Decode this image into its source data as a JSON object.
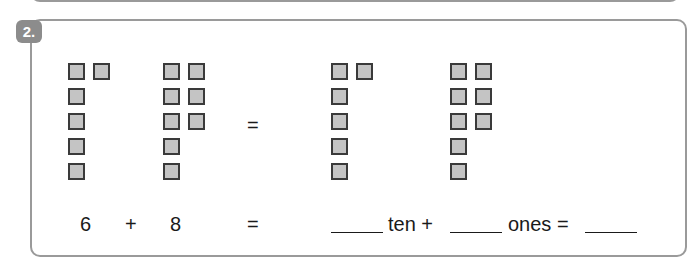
{
  "question": {
    "number": "2."
  },
  "groups": [
    {
      "name": "addend-1-blocks",
      "count": 6,
      "squares": [
        [
          68,
          63
        ],
        [
          93,
          63
        ],
        [
          68,
          88
        ],
        [
          68,
          113
        ],
        [
          68,
          138
        ],
        [
          68,
          163
        ]
      ]
    },
    {
      "name": "addend-2-blocks",
      "count": 8,
      "squares": [
        [
          163,
          63
        ],
        [
          188,
          63
        ],
        [
          163,
          88
        ],
        [
          188,
          88
        ],
        [
          163,
          113
        ],
        [
          188,
          113
        ],
        [
          163,
          138
        ],
        [
          163,
          163
        ]
      ]
    },
    {
      "name": "result-ten-blocks",
      "count": 6,
      "squares": [
        [
          331,
          63
        ],
        [
          356,
          63
        ],
        [
          331,
          88
        ],
        [
          331,
          113
        ],
        [
          331,
          138
        ],
        [
          331,
          163
        ]
      ]
    },
    {
      "name": "result-ones-blocks",
      "count": 8,
      "squares": [
        [
          450,
          63
        ],
        [
          475,
          63
        ],
        [
          450,
          88
        ],
        [
          475,
          88
        ],
        [
          450,
          113
        ],
        [
          475,
          113
        ],
        [
          450,
          138
        ],
        [
          450,
          163
        ]
      ]
    }
  ],
  "block_row_equals": "=",
  "equation": {
    "addend1": "6",
    "plus": "+",
    "addend2": "8",
    "equals": "=",
    "ten_label": "ten +",
    "ones_label": "ones =",
    "blank_tens": "",
    "blank_ones": "",
    "blank_total": ""
  }
}
